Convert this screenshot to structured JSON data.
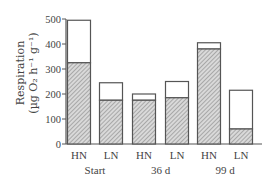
{
  "chart_data": {
    "type": "bar",
    "stacked": true,
    "title": "",
    "xlabel": "",
    "ylabel": "Respiration (µg O₂ h⁻¹ g⁻¹)",
    "ylabel_line1": "Respiration",
    "ylabel_line2": "(µg O₂ h⁻¹ g⁻¹)",
    "ylim": [
      0,
      500
    ],
    "yticks": [
      0,
      100,
      200,
      300,
      400,
      500
    ],
    "grid": false,
    "legend": null,
    "categories": [
      "HN",
      "LN",
      "HN",
      "LN",
      "HN",
      "LN"
    ],
    "groups": [
      {
        "label": "Start",
        "categories": [
          "HN",
          "LN"
        ]
      },
      {
        "label": "36 d",
        "categories": [
          "HN",
          "LN"
        ]
      },
      {
        "label": "99 d",
        "categories": [
          "HN",
          "LN"
        ]
      }
    ],
    "series": [
      {
        "name": "hatched (lower segment)",
        "values": [
          325,
          175,
          175,
          185,
          380,
          60
        ]
      },
      {
        "name": "open (upper segment)",
        "values": [
          170,
          70,
          25,
          65,
          25,
          155
        ]
      }
    ],
    "totals": [
      495,
      245,
      200,
      250,
      405,
      215
    ]
  }
}
